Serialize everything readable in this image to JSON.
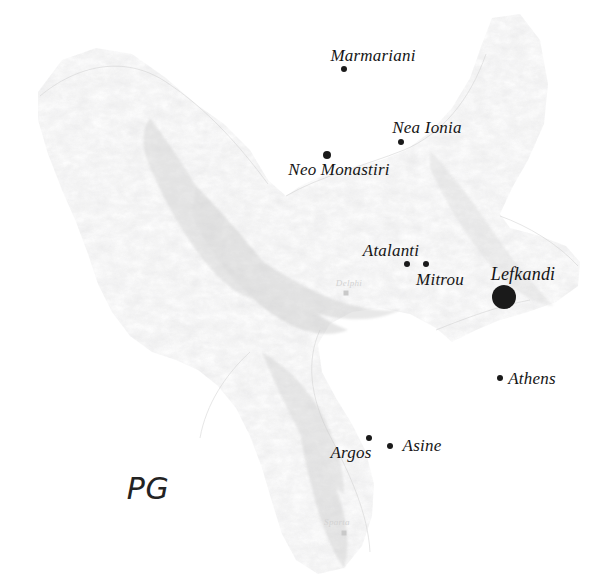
{
  "map": {
    "title": "Protogeometric period site distribution map of central and southern Greece",
    "width": 593,
    "height": 582,
    "background_color": "#ffffff",
    "terrain_color": "#c8c8c8",
    "marker_color": "#1a1a1a",
    "faint_label_color": "#d2d2d2"
  },
  "period_caption": {
    "label": "PG",
    "x": 148,
    "y": 488,
    "font_size": 30
  },
  "sites": [
    {
      "name": "Marmariani",
      "label_x": 373,
      "label_y": 56,
      "dot_x": 344,
      "dot_y": 69,
      "dot_size": 6,
      "font_size": 17,
      "prominence": "normal"
    },
    {
      "name": "Nea Ionia",
      "label_x": 427,
      "label_y": 128,
      "dot_x": 401,
      "dot_y": 142,
      "dot_size": 6,
      "font_size": 17,
      "prominence": "normal"
    },
    {
      "name": "Neo Monastiri",
      "label_x": 339,
      "label_y": 170,
      "dot_x": 327,
      "dot_y": 155,
      "dot_size": 8,
      "font_size": 17,
      "prominence": "normal"
    },
    {
      "name": "Atalanti",
      "label_x": 391,
      "label_y": 251,
      "dot_x": 407,
      "dot_y": 264,
      "dot_size": 6,
      "font_size": 17,
      "prominence": "normal"
    },
    {
      "name": "Mitrou",
      "label_x": 440,
      "label_y": 280,
      "dot_x": 426,
      "dot_y": 264,
      "dot_size": 6,
      "font_size": 17,
      "prominence": "normal"
    },
    {
      "name": "Lefkandi",
      "label_x": 523,
      "label_y": 274,
      "dot_x": 504,
      "dot_y": 297,
      "dot_size": 24,
      "font_size": 18,
      "prominence": "major"
    },
    {
      "name": "Athens",
      "label_x": 532,
      "label_y": 379,
      "dot_x": 500,
      "dot_y": 378,
      "dot_size": 6,
      "font_size": 17,
      "prominence": "normal"
    },
    {
      "name": "Argos",
      "label_x": 351,
      "label_y": 453,
      "dot_x": 369,
      "dot_y": 438,
      "dot_size": 6,
      "font_size": 17,
      "prominence": "normal"
    },
    {
      "name": "Asine",
      "label_x": 422,
      "label_y": 446,
      "dot_x": 390,
      "dot_y": 446,
      "dot_size": 6,
      "font_size": 17,
      "prominence": "normal"
    }
  ],
  "reference_places": [
    {
      "name": "Delphi",
      "label_x": 349,
      "label_y": 283,
      "dot_x": 346,
      "dot_y": 293,
      "dot_size": 5,
      "font_size": 9
    },
    {
      "name": "Sparta",
      "label_x": 337,
      "label_y": 522,
      "dot_x": 344,
      "dot_y": 533,
      "dot_size": 5,
      "font_size": 9
    }
  ]
}
